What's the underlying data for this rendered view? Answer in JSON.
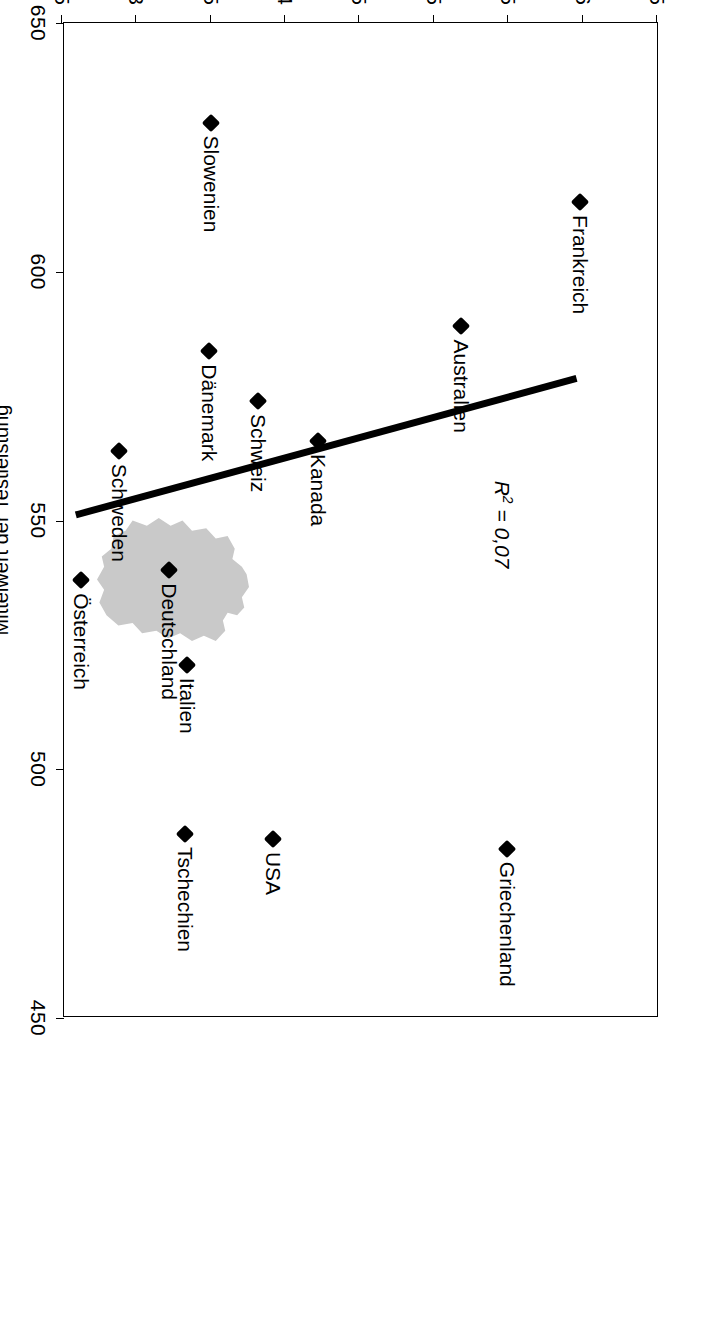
{
  "chart_data": {
    "type": "scatter",
    "title": "",
    "xlabel": "Mittelwert der Testleistung",
    "ylabel": "Durchschnittliche Unterrichtszeit pro Woche (in Zeitstunden)",
    "xlim": [
      650,
      450
    ],
    "ylim": [
      2.5,
      6.5
    ],
    "xticks": [
      650,
      600,
      550,
      500,
      450
    ],
    "xticklabels": [
      "650",
      "600",
      "550",
      "500",
      "450"
    ],
    "yticks": [
      2.5,
      3,
      3.5,
      4,
      4.5,
      5,
      5.5,
      6,
      6.5
    ],
    "yticklabels": [
      "2,5",
      "3",
      "3,5",
      "4",
      "4,5",
      "5",
      "5,5",
      "6",
      "6,5"
    ],
    "grid": false,
    "legend": false,
    "annotations": [
      {
        "name": "r-squared",
        "text_html": "R<sup>2</sup> = 0,07",
        "text": "R2 = 0,07"
      }
    ],
    "trendline": {
      "visible": true,
      "color": "#000000",
      "from": {
        "x": 538,
        "y": 2.63
      },
      "to": {
        "x": 574,
        "y": 5.95
      }
    },
    "background_shape": {
      "name": "germany-map-silhouette",
      "color": "#c9c9c9",
      "at": {
        "x": 540,
        "y": 3.22
      }
    },
    "points": [
      {
        "label": "Frankreich",
        "x": 614,
        "y": 5.98
      },
      {
        "label": "Griechenland",
        "x": 484,
        "y": 5.49
      },
      {
        "label": "Australien",
        "x": 589,
        "y": 5.18
      },
      {
        "label": "Kanada",
        "x": 566,
        "y": 4.22
      },
      {
        "label": "Schweiz",
        "x": 574,
        "y": 3.82
      },
      {
        "label": "USA",
        "x": 486,
        "y": 3.92
      },
      {
        "label": "Slowenien",
        "x": 630,
        "y": 3.5
      },
      {
        "label": "Dänemark",
        "x": 584,
        "y": 3.49
      },
      {
        "label": "Italien",
        "x": 521,
        "y": 3.34
      },
      {
        "label": "Tschechien",
        "x": 487,
        "y": 3.33
      },
      {
        "label": "Deutschland",
        "x": 540,
        "y": 3.22
      },
      {
        "label": "Schweden",
        "x": 564,
        "y": 2.88
      },
      {
        "label": "Österreich",
        "x": 538,
        "y": 2.63
      }
    ]
  },
  "axes": {
    "value_axis_title": "Mittelwert der Testleistung",
    "hours_axis_title": "Durchschnittliche Unterrichtszeit pro Woche (in Zeitstunden)"
  }
}
